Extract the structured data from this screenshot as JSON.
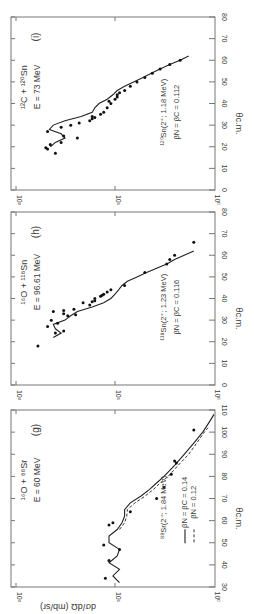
{
  "figure": {
    "orientation": "rotated 90° counter-clockwise",
    "ylabel": "dσ/dΩ (mb/sr)",
    "xlabel": "θc.m.",
    "yticks": [
      "10²",
      "10¹",
      "10⁰"
    ]
  },
  "chart_data": [
    {
      "type": "scatter",
      "panel": "(i)",
      "title": "¹²C + ¹²⁰Sn",
      "subtitle": "E = 73 MeV",
      "annotation": [
        "¹²⁰Sn(2⁺; 1.18 MeV)",
        "βN = βC = 0.112"
      ],
      "xlabel": "θc.m.",
      "ylabel": "dσ/dΩ (mb/sr)",
      "xlim": [
        0,
        80
      ],
      "xticks": [
        0,
        10,
        20,
        30,
        40,
        50,
        60,
        70,
        80
      ],
      "ylim": [
        1,
        100
      ],
      "yscale": "log",
      "series": [
        {
          "name": "data",
          "x": [
            17,
            19,
            19.5,
            21,
            22,
            24,
            25,
            27,
            29,
            30,
            31,
            32,
            33,
            33.5,
            34,
            35,
            36,
            38,
            40,
            41,
            42,
            43,
            44,
            45,
            46,
            48,
            50,
            52,
            54,
            56,
            58,
            60
          ],
          "y": [
            40,
            48,
            50,
            45,
            35,
            24,
            33,
            48,
            35,
            28,
            23,
            18,
            17,
            16,
            17,
            14,
            13,
            12,
            11,
            11.5,
            10,
            9.5,
            9.5,
            9,
            8,
            7,
            6,
            5,
            4.2,
            3.5,
            2.8,
            2.2
          ]
        },
        {
          "name": "DWBA fit (solid)",
          "x": [
            20,
            22,
            24,
            26,
            28,
            30,
            32,
            34,
            36,
            38,
            40,
            42,
            44,
            46,
            48,
            50,
            52,
            54,
            56,
            58,
            60,
            62
          ],
          "y": [
            45,
            40,
            32,
            35,
            46,
            42,
            32,
            22,
            17,
            16,
            14.5,
            12,
            10.5,
            9.5,
            8,
            6.5,
            5.2,
            4.3,
            3.5,
            2.8,
            2.2,
            1.8
          ]
        }
      ]
    },
    {
      "type": "scatter",
      "panel": "(h)",
      "title": "¹⁶O + ¹¹⁸Sn",
      "subtitle": "E = 96.61 MeV",
      "annotation": [
        "¹¹⁸Sn(2⁺; 1.23 MeV)",
        "βN = βC = 0.116"
      ],
      "xlabel": "θc.m.",
      "ylabel": "dσ/dΩ (mb/sr)",
      "xlim": [
        0,
        80
      ],
      "xticks": [
        0,
        10,
        20,
        30,
        40,
        50,
        60,
        70,
        80
      ],
      "ylim": [
        1,
        100
      ],
      "yscale": "log",
      "series": [
        {
          "name": "data",
          "x": [
            18,
            24,
            25,
            27,
            28.5,
            30,
            32,
            32.5,
            33,
            34,
            34.5,
            35,
            37,
            38,
            38.5,
            39,
            40,
            41,
            41.5,
            42,
            43,
            44,
            46,
            52,
            56,
            58,
            60,
            66
          ],
          "y": [
            60,
            40,
            33,
            48,
            38,
            44,
            30,
            25,
            33,
            42,
            33,
            26,
            18,
            21,
            17,
            16,
            16,
            14,
            13.5,
            13,
            12,
            11,
            8,
            5,
            3,
            2.8,
            2.5,
            1.6
          ]
        },
        {
          "name": "DWBA fit (solid)",
          "x": [
            22,
            24,
            26,
            28,
            30,
            32,
            34,
            36,
            38,
            40,
            42,
            44,
            46,
            48,
            50,
            52,
            54,
            56,
            58,
            60,
            62
          ],
          "y": [
            42,
            35,
            40,
            42,
            32,
            28,
            24,
            17,
            13,
            11,
            10,
            9.2,
            8.5,
            7.5,
            6,
            4.8,
            3.8,
            3,
            2.5,
            2,
            1.6
          ]
        }
      ]
    },
    {
      "type": "scatter",
      "panel": "(g)",
      "title": "¹⁶O + ⁸⁸Sr",
      "subtitle": "E = 60 MeV",
      "annotation": [
        "⁸⁸Sr(2⁺; 1.84 MeV)"
      ],
      "legend": [
        {
          "style": "solid",
          "label": "βN = βC = 0.14"
        },
        {
          "style": "dashed",
          "label": "βN = 0.12"
        }
      ],
      "xlabel": "θc.m.",
      "ylabel": "dσ/dΩ (mb/sr)",
      "xlim": [
        30,
        110
      ],
      "xticks": [
        30,
        40,
        50,
        60,
        70,
        80,
        90,
        100,
        110
      ],
      "ylim": [
        1,
        100
      ],
      "yscale": "log",
      "series": [
        {
          "name": "data",
          "x": [
            34,
            42,
            47,
            49,
            58,
            59,
            64,
            70,
            75,
            81,
            86,
            87,
            101
          ],
          "y": [
            12.5,
            11.5,
            9,
            13,
            11.5,
            10.5,
            7,
            3.8,
            3.2,
            2.7,
            2.4,
            2.5,
            1.6
          ]
        },
        {
          "name": "βN = βC = 0.14 (solid)",
          "x": [
            32,
            35,
            38,
            41,
            44,
            47,
            50,
            53,
            56,
            59,
            62,
            65,
            68,
            71,
            74,
            77,
            80,
            85,
            90,
            95,
            100,
            105,
            108
          ],
          "y": [
            9,
            10.5,
            9,
            11.5,
            9.5,
            9,
            11.5,
            11.5,
            9.5,
            8.5,
            8,
            8,
            7,
            5.5,
            4.5,
            3.8,
            3.2,
            2.5,
            2,
            1.6,
            1.3,
            1.1,
            1.0
          ]
        },
        {
          "name": "βN = 0.12 (dashed)",
          "x": [
            56,
            59,
            62,
            65,
            68,
            71,
            74,
            77,
            80,
            85,
            90,
            95,
            100,
            102
          ],
          "y": [
            9,
            8,
            7.6,
            7.5,
            6.3,
            5,
            4.1,
            3.5,
            2.9,
            2.3,
            1.8,
            1.5,
            1.25,
            1.15
          ]
        }
      ]
    }
  ]
}
